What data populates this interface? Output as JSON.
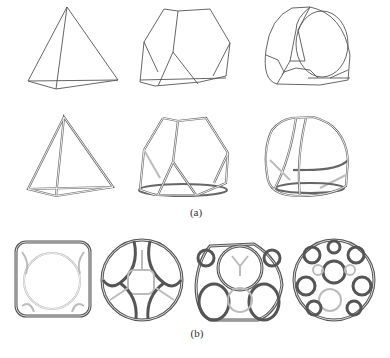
{
  "figure": {
    "panel_a": {
      "label": "(a)",
      "rows": [
        {
          "style": "single-line wireframe",
          "shapes": [
            "tetrahedron",
            "truncated-tetrahedron",
            "rounded-truncated-polyhedron"
          ]
        },
        {
          "style": "double-line (tube) wireframe",
          "shapes": [
            "tetrahedron",
            "truncated-tetrahedron",
            "rounded-truncated-polyhedron"
          ]
        }
      ]
    },
    "panel_b": {
      "label": "(b)",
      "shapes": [
        "rounded-cube-frame",
        "truncated-octahedron-frame",
        "truncated-icosahedron-frame",
        "rhombicosidodecahedron-frame"
      ]
    }
  }
}
